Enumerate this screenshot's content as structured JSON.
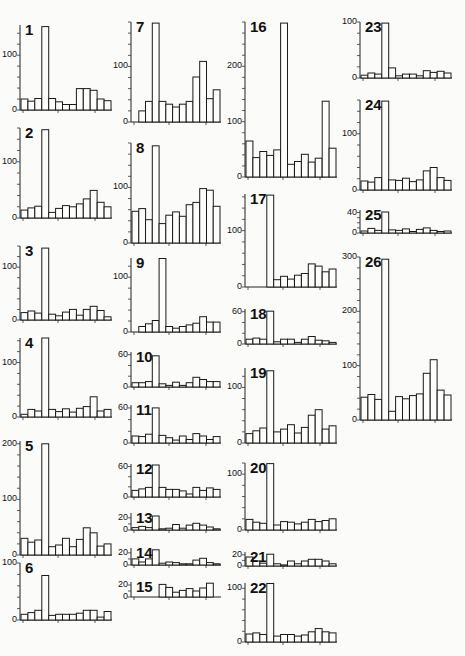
{
  "chart_data": [
    {
      "type": "bar",
      "title": "1",
      "yticks": [
        0,
        100
      ],
      "ylim": [
        0,
        155
      ],
      "values": [
        20,
        16,
        21,
        152,
        21,
        15,
        10,
        10,
        39,
        39,
        36,
        20,
        17
      ]
    },
    {
      "type": "bar",
      "title": "2",
      "yticks": [
        0,
        100
      ],
      "ylim": [
        0,
        160
      ],
      "values": [
        14,
        18,
        21,
        157,
        10,
        17,
        22,
        20,
        25,
        34,
        49,
        28,
        20
      ]
    },
    {
      "type": "bar",
      "title": "3",
      "yticks": [
        0,
        100
      ],
      "ylim": [
        0,
        140
      ],
      "values": [
        14,
        17,
        13,
        136,
        11,
        8,
        15,
        20,
        9,
        20,
        26,
        18,
        6
      ]
    },
    {
      "type": "bar",
      "title": "4",
      "yticks": [
        0,
        100
      ],
      "ylim": [
        0,
        145
      ],
      "values": [
        5,
        14,
        11,
        145,
        14,
        10,
        15,
        9,
        16,
        19,
        37,
        11,
        14
      ]
    },
    {
      "type": "bar",
      "title": "5",
      "yticks": [
        0,
        100,
        200
      ],
      "ylim": [
        0,
        205
      ],
      "values": [
        30,
        23,
        27,
        200,
        15,
        18,
        30,
        15,
        28,
        49,
        40,
        16,
        20
      ]
    },
    {
      "type": "bar",
      "title": "6",
      "yticks": [
        0,
        100
      ],
      "ylim": [
        0,
        100
      ],
      "values": [
        10,
        13,
        17,
        78,
        8,
        10,
        10,
        10,
        12,
        17,
        17,
        5,
        15
      ]
    },
    {
      "type": "bar",
      "title": "7",
      "yticks": [
        0,
        100
      ],
      "ylim": [
        0,
        180
      ],
      "values": [
        20,
        37,
        178,
        37,
        32,
        27,
        32,
        37,
        81,
        109,
        42,
        58
      ]
    },
    {
      "type": "bar",
      "title": "8",
      "yticks": [
        0,
        100
      ],
      "ylim": [
        0,
        180
      ],
      "values": [
        57,
        62,
        42,
        175,
        35,
        50,
        56,
        48,
        69,
        73,
        98,
        95,
        66
      ]
    },
    {
      "type": "bar",
      "title": "9",
      "yticks": [
        0,
        100
      ],
      "ylim": [
        0,
        135
      ],
      "values": [
        10,
        15,
        21,
        134,
        10,
        7,
        10,
        13,
        16,
        28,
        18,
        18
      ]
    },
    {
      "type": "bar",
      "title": "10",
      "yticks": [
        0,
        60
      ],
      "ylim": [
        0,
        65
      ],
      "values": [
        8,
        8,
        10,
        58,
        6,
        3,
        9,
        3,
        8,
        18,
        14,
        10,
        10
      ]
    },
    {
      "type": "bar",
      "title": "11",
      "yticks": [
        0,
        60
      ],
      "ylim": [
        0,
        65
      ],
      "values": [
        12,
        11,
        15,
        60,
        13,
        9,
        5,
        12,
        6,
        16,
        12,
        6,
        11
      ]
    },
    {
      "type": "bar",
      "title": "12",
      "yticks": [
        0,
        60
      ],
      "ylim": [
        0,
        65
      ],
      "values": [
        13,
        16,
        19,
        63,
        19,
        15,
        15,
        12,
        6,
        19,
        13,
        18,
        15
      ]
    },
    {
      "type": "bar",
      "title": "13",
      "yticks": [
        0,
        20
      ],
      "ylim": [
        0,
        28
      ],
      "values": [
        4,
        6,
        4,
        23,
        2,
        3,
        9,
        3,
        8,
        11,
        8,
        5,
        2
      ]
    },
    {
      "type": "bar",
      "title": "14",
      "yticks": [
        0,
        20
      ],
      "ylim": [
        0,
        28
      ],
      "values": [
        10,
        5,
        10,
        25,
        3,
        5,
        4,
        2,
        2,
        8,
        11,
        4,
        2
      ]
    },
    {
      "type": "bar",
      "title": "15",
      "yticks": [
        0,
        20
      ],
      "ylim": [
        0,
        25
      ],
      "values": [
        21,
        16,
        8,
        11,
        14,
        10,
        15,
        23
      ]
    },
    {
      "type": "bar",
      "title": "16",
      "yticks": [
        0,
        100,
        200
      ],
      "ylim": [
        0,
        280
      ],
      "values": [
        65,
        35,
        46,
        39,
        49,
        278,
        23,
        28,
        41,
        27,
        34,
        137,
        52
      ]
    },
    {
      "type": "bar",
      "title": "17",
      "yticks": [
        0,
        100
      ],
      "ylim": [
        0,
        165
      ],
      "values": [
        163,
        13,
        19,
        14,
        21,
        24,
        41,
        37,
        27,
        32
      ]
    },
    {
      "type": "bar",
      "title": "18",
      "yticks": [
        0,
        60
      ],
      "ylim": [
        0,
        65
      ],
      "values": [
        9,
        11,
        9,
        61,
        4,
        9,
        9,
        3,
        9,
        14,
        7,
        6,
        3
      ]
    },
    {
      "type": "bar",
      "title": "19",
      "yticks": [
        0,
        100
      ],
      "ylim": [
        0,
        135
      ],
      "values": [
        17,
        22,
        27,
        130,
        20,
        25,
        33,
        18,
        28,
        50,
        60,
        25,
        31
      ]
    },
    {
      "type": "bar",
      "title": "20",
      "yticks": [
        0,
        100
      ],
      "ylim": [
        0,
        120
      ],
      "values": [
        19,
        14,
        12,
        119,
        9,
        15,
        14,
        11,
        14,
        19,
        15,
        17,
        20
      ]
    },
    {
      "type": "bar",
      "title": "21",
      "yticks": [
        0,
        20
      ],
      "ylim": [
        0,
        25
      ],
      "values": [
        16,
        9,
        5,
        21,
        4,
        2,
        9,
        4,
        9,
        12,
        12,
        9,
        4
      ]
    },
    {
      "type": "bar",
      "title": "22",
      "yticks": [
        0,
        100
      ],
      "ylim": [
        0,
        110
      ],
      "values": [
        15,
        17,
        14,
        109,
        11,
        14,
        14,
        11,
        13,
        19,
        25,
        19,
        17
      ]
    },
    {
      "type": "bar",
      "title": "23",
      "yticks": [
        0,
        100
      ],
      "ylim": [
        0,
        100
      ],
      "values": [
        5,
        9,
        7,
        98,
        18,
        4,
        7,
        7,
        4,
        13,
        10,
        12,
        9
      ]
    },
    {
      "type": "bar",
      "title": "24",
      "yticks": [
        0,
        100
      ],
      "ylim": [
        0,
        160
      ],
      "values": [
        16,
        14,
        22,
        158,
        18,
        17,
        21,
        15,
        18,
        34,
        40,
        22,
        17
      ]
    },
    {
      "type": "bar",
      "title": "25",
      "yticks": [
        0,
        40
      ],
      "ylim": [
        0,
        45
      ],
      "values": [
        4,
        9,
        5,
        41,
        6,
        5,
        8,
        3,
        7,
        10,
        5,
        3,
        4
      ]
    },
    {
      "type": "bar",
      "title": "26",
      "yticks": [
        0,
        100,
        200,
        300
      ],
      "ylim": [
        0,
        300
      ],
      "values": [
        42,
        47,
        38,
        296,
        16,
        43,
        39,
        45,
        48,
        86,
        111,
        55,
        46
      ]
    }
  ],
  "layout": [
    {
      "x": 20,
      "yTop": 25,
      "yBase": 110,
      "w": 92
    },
    {
      "x": 20,
      "yTop": 128,
      "yBase": 218,
      "w": 92
    },
    {
      "x": 20,
      "yTop": 246,
      "yBase": 320,
      "w": 92
    },
    {
      "x": 20,
      "yTop": 338,
      "yBase": 417,
      "w": 92
    },
    {
      "x": 20,
      "yTop": 441,
      "yBase": 555,
      "w": 92
    },
    {
      "x": 20,
      "yTop": 563,
      "yBase": 620,
      "w": 92
    },
    {
      "x": 131,
      "yTop": 22,
      "yBase": 122,
      "w": 90
    },
    {
      "x": 131,
      "yTop": 143,
      "yBase": 243,
      "w": 90
    },
    {
      "x": 131,
      "yTop": 258,
      "yBase": 332,
      "w": 90
    },
    {
      "x": 131,
      "yTop": 352,
      "yBase": 387,
      "w": 90
    },
    {
      "x": 131,
      "yTop": 405,
      "yBase": 443,
      "w": 90
    },
    {
      "x": 131,
      "yTop": 464,
      "yBase": 497,
      "w": 90
    },
    {
      "x": 131,
      "yTop": 513,
      "yBase": 530,
      "w": 90
    },
    {
      "x": 131,
      "yTop": 548,
      "yBase": 565,
      "w": 90
    },
    {
      "x": 131,
      "yTop": 582,
      "yBase": 597,
      "w": 90
    },
    {
      "x": 245,
      "yTop": 22,
      "yBase": 177,
      "w": 92
    },
    {
      "x": 245,
      "yTop": 194,
      "yBase": 287,
      "w": 92
    },
    {
      "x": 245,
      "yTop": 309,
      "yBase": 344,
      "w": 92
    },
    {
      "x": 245,
      "yTop": 368,
      "yBase": 443,
      "w": 92
    },
    {
      "x": 245,
      "yTop": 463,
      "yBase": 530,
      "w": 92
    },
    {
      "x": 245,
      "yTop": 552,
      "yBase": 566,
      "w": 92
    },
    {
      "x": 245,
      "yTop": 583,
      "yBase": 642,
      "w": 92
    },
    {
      "x": 360,
      "yTop": 22,
      "yBase": 78,
      "w": 92
    },
    {
      "x": 360,
      "yTop": 100,
      "yBase": 190,
      "w": 92
    },
    {
      "x": 360,
      "yTop": 210,
      "yBase": 233,
      "w": 92
    },
    {
      "x": 360,
      "yTop": 257,
      "yBase": 420,
      "w": 92
    }
  ]
}
